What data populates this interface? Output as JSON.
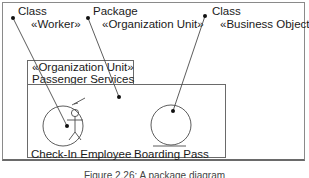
{
  "annotations": [
    {
      "line1": "Class",
      "line2": "«Worker»"
    },
    {
      "line1": "Package",
      "line2": "«Organization Unit»"
    },
    {
      "line1": "Class",
      "line2": "«Business Object»"
    }
  ],
  "package": {
    "stereotype": "«Organization Unit»",
    "name": "Passenger Services"
  },
  "elements": [
    {
      "name": "Check-In Employee",
      "icon": "worker-icon"
    },
    {
      "name": "Boarding Pass",
      "icon": "business-object-icon"
    }
  ],
  "caption": "Figure 2.26: A package diagram",
  "colors": {
    "line": "#4a4a4a",
    "frame": "#8a8a8a",
    "text": "#1a1a1a"
  }
}
